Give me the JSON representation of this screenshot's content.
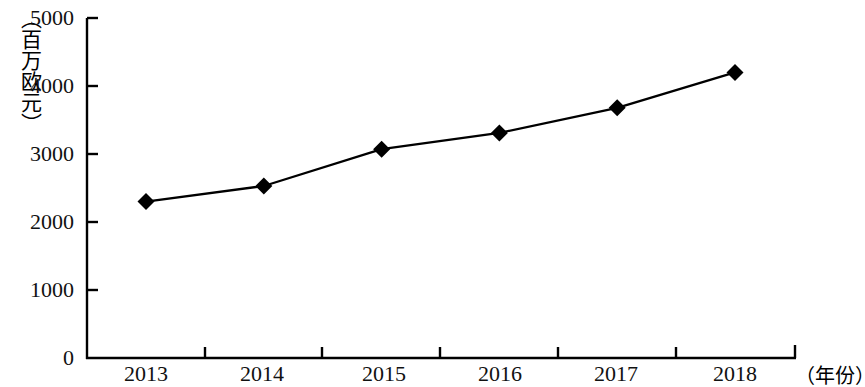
{
  "chart_data": {
    "type": "line",
    "title": "",
    "subtitle": "",
    "xlabel": "（年份）",
    "ylabel": "（百万欧元）",
    "categories": [
      "2013",
      "2014",
      "2015",
      "2016",
      "2017",
      "2018"
    ],
    "values": [
      2300,
      2530,
      3070,
      3310,
      3680,
      4200
    ],
    "series": [
      {
        "name": "",
        "values": [
          2300,
          2530,
          3070,
          3310,
          3680,
          4200
        ]
      }
    ],
    "ylim": [
      0,
      5000
    ],
    "ytick_labels": [
      "0",
      "1000",
      "2000",
      "3000",
      "4000",
      "5000"
    ],
    "ytick_values": [
      0,
      1000,
      2000,
      3000,
      4000,
      5000
    ],
    "xtick_labels": [
      "2013",
      "2014",
      "2015",
      "2016",
      "2017",
      "2018"
    ],
    "grid": false,
    "legend": "none",
    "marker": "diamond",
    "line_color": "#000000",
    "marker_color": "#000000",
    "axis_color": "#000000",
    "background_color": "#ffffff"
  }
}
